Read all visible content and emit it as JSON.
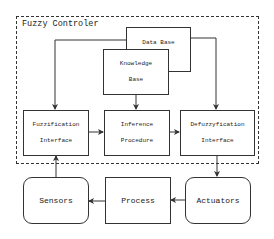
{
  "diagram": {
    "container": {
      "label": "Fuzzy Controler",
      "style": "dashed"
    },
    "nodes": {
      "data_base": {
        "lines": [
          "Data Base"
        ]
      },
      "knowledge_base": {
        "lines": [
          "Knowledge",
          "Base"
        ]
      },
      "fuzzification": {
        "lines": [
          "Fuzzification",
          "Interface"
        ]
      },
      "inference": {
        "lines": [
          "Inference",
          "Procedure"
        ]
      },
      "defuzzification": {
        "lines": [
          "Defuzzyfication",
          "Interface"
        ]
      },
      "sensors": {
        "lines": [
          "Sensors"
        ]
      },
      "process": {
        "lines": [
          "Process"
        ]
      },
      "actuators": {
        "lines": [
          "Actuators"
        ]
      }
    },
    "edges": [
      {
        "from": "Data Base",
        "to": "Fuzzification Interface"
      },
      {
        "from": "Data Base",
        "to": "Defuzzyfication Interface"
      },
      {
        "from": "Knowledge Base",
        "to": "Inference Procedure"
      },
      {
        "from": "Fuzzification Interface",
        "to": "Inference Procedure"
      },
      {
        "from": "Inference Procedure",
        "to": "Defuzzyfication Interface"
      },
      {
        "from": "Defuzzyfication Interface",
        "to": "Actuators"
      },
      {
        "from": "Actuators",
        "to": "Process"
      },
      {
        "from": "Process",
        "to": "Sensors"
      },
      {
        "from": "Sensors",
        "to": "Fuzzification Interface"
      }
    ]
  }
}
